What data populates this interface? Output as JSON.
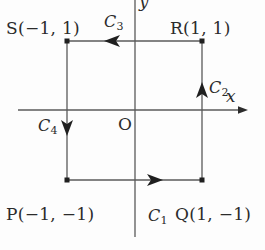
{
  "figure": {
    "background_color": "#fdfdfd",
    "line_color": "#5a5a5a",
    "text_color": "#2b2b2b"
  },
  "axes": {
    "x_label": "x",
    "y_label": "y",
    "origin_label": "O",
    "x_axis": {
      "y_px": 110,
      "x_start_px": 18,
      "x_end_px": 248,
      "arrow": "right"
    },
    "y_axis": {
      "x_px": 135,
      "y_start_px": 0,
      "y_end_px": 237,
      "arrow": "none"
    }
  },
  "vertices": [
    {
      "name": "S",
      "label": "S(−1, 1)",
      "x": -1,
      "y": 1,
      "px": 67,
      "py": 41
    },
    {
      "name": "R",
      "label": "R(1, 1)",
      "x": 1,
      "y": 1,
      "px": 202,
      "py": 41
    },
    {
      "name": "Q",
      "label": "Q(1, −1)",
      "x": 1,
      "y": -1,
      "px": 202,
      "py": 180
    },
    {
      "name": "P",
      "label": "P(−1, −1)",
      "x": -1,
      "y": -1,
      "px": 67,
      "py": 180
    }
  ],
  "curves": [
    {
      "id": "C1",
      "name": "C",
      "subscript": "1",
      "from": "P",
      "to": "Q",
      "direction": "right",
      "arrow_px": {
        "x": 155,
        "y": 180
      }
    },
    {
      "id": "C2",
      "name": "C",
      "subscript": "2",
      "from": "Q",
      "to": "R",
      "direction": "up",
      "arrow_px": {
        "x": 202,
        "y": 90
      }
    },
    {
      "id": "C3",
      "name": "C",
      "subscript": "3",
      "from": "R",
      "to": "S",
      "direction": "left",
      "arrow_px": {
        "x": 112,
        "y": 41
      }
    },
    {
      "id": "C4",
      "name": "C",
      "subscript": "4",
      "from": "S",
      "to": "P",
      "direction": "down",
      "arrow_px": {
        "x": 67,
        "y": 128
      }
    }
  ]
}
